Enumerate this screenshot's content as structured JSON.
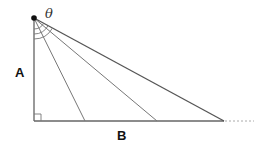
{
  "diagram": {
    "type": "right-triangle-with-angle-rays",
    "labels": {
      "vertical_side": "A",
      "base_side": "B",
      "angle": "θ"
    },
    "colors": {
      "line": "#555555",
      "ray": "#777777",
      "dashed": "#aaaaaa",
      "vertex": "#111111"
    },
    "geometry": {
      "apex": [
        34,
        18
      ],
      "right_angle_corner": [
        34,
        121
      ],
      "base_end": [
        224,
        121
      ],
      "dashed_extension_end": [
        253,
        121
      ],
      "rays_base_x": [
        85,
        157,
        224
      ],
      "arc_radii": [
        11,
        16,
        21
      ]
    }
  }
}
